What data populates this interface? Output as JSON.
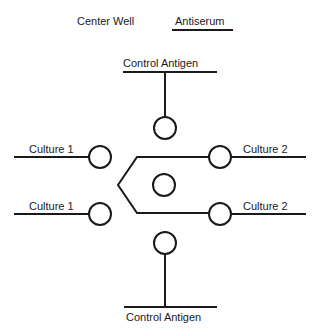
{
  "figure": {
    "type": "immunodiffusion-plate-schematic",
    "background_color": "#ffffff",
    "stroke_color": "#1a1a1a",
    "width": 317,
    "height": 336
  },
  "headers": {
    "center_well": "Center Well",
    "antiserum": "Antiserum"
  },
  "labels": {
    "top_control_antigen": "Control Antigen",
    "bottom_control_antigen": "Control Antigen",
    "left_upper": "Culture 1",
    "left_lower": "Culture 1",
    "right_upper": "Culture 2",
    "right_lower": "Culture 2"
  },
  "wells": [
    {
      "name": "top-well",
      "cx": 165,
      "cy": 128,
      "r": 11
    },
    {
      "name": "center-well",
      "cx": 164,
      "cy": 185,
      "r": 11
    },
    {
      "name": "left-upper-well",
      "cx": 100,
      "cy": 157,
      "r": 11
    },
    {
      "name": "left-lower-well",
      "cx": 100,
      "cy": 214,
      "r": 11
    },
    {
      "name": "right-upper-well",
      "cx": 220,
      "cy": 157,
      "r": 11
    },
    {
      "name": "right-lower-well",
      "cx": 220,
      "cy": 214,
      "r": 11
    },
    {
      "name": "bottom-well",
      "cx": 165,
      "cy": 243,
      "r": 11
    }
  ],
  "rules": [
    {
      "name": "antiserum-underline",
      "x1": 172,
      "y1": 30,
      "x2": 233,
      "y2": 30
    },
    {
      "name": "top-control-antigen-rule",
      "x1": 123,
      "y1": 72,
      "x2": 217,
      "y2": 72
    },
    {
      "name": "bottom-control-antigen-rule",
      "x1": 124,
      "y1": 307,
      "x2": 217,
      "y2": 307
    },
    {
      "name": "left-upper-rule",
      "x1": 14,
      "y1": 157,
      "x2": 89,
      "y2": 157
    },
    {
      "name": "left-lower-rule",
      "x1": 14,
      "y1": 214,
      "x2": 89,
      "y2": 214
    },
    {
      "name": "right-upper-rule",
      "x1": 231,
      "y1": 157,
      "x2": 306,
      "y2": 157
    },
    {
      "name": "right-lower-rule",
      "x1": 231,
      "y1": 214,
      "x2": 306,
      "y2": 214
    }
  ],
  "stems": [
    {
      "name": "top-stem",
      "x1": 165,
      "y1": 72,
      "x2": 165,
      "y2": 117
    },
    {
      "name": "bottom-stem",
      "x1": 165,
      "y1": 254,
      "x2": 165,
      "y2": 307
    }
  ],
  "hexagon": {
    "name": "center-well-hexagon",
    "points": "199,157 137,157 118,185 137,213 199,213"
  },
  "hexagon_arms": [
    {
      "name": "hex-arm-upper-right",
      "x1": 199,
      "y1": 157,
      "x2": 209,
      "y2": 157
    },
    {
      "name": "hex-arm-lower-right",
      "x1": 199,
      "y1": 213,
      "x2": 209,
      "y2": 213
    }
  ]
}
